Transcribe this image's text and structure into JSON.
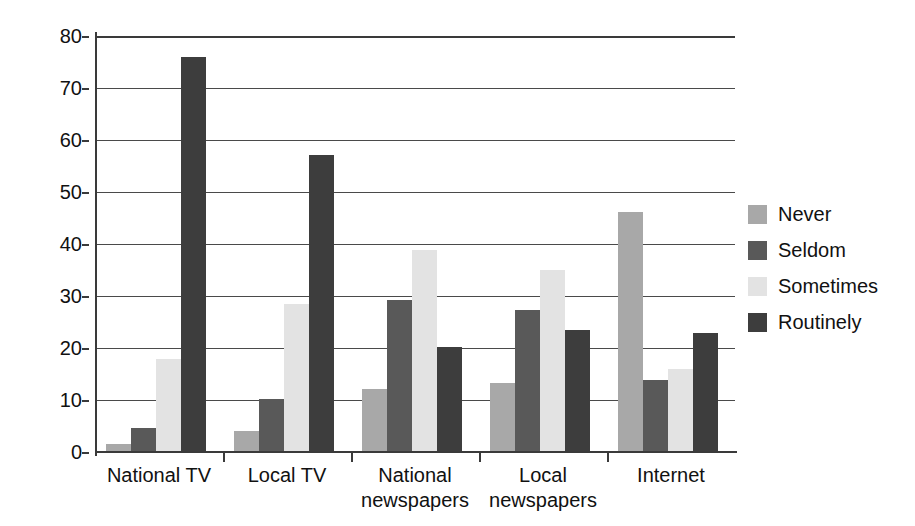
{
  "chart_data": {
    "type": "bar",
    "title": "",
    "xlabel": "",
    "ylabel": "",
    "ylim": [
      0,
      80
    ],
    "ytick_step": 10,
    "yticks": [
      80,
      70,
      60,
      50,
      40,
      30,
      20,
      10,
      0
    ],
    "grid": true,
    "legend_position": "right",
    "categories": [
      {
        "label": "National TV",
        "line1": "National TV",
        "line2": ""
      },
      {
        "label": "Local TV",
        "line1": "Local TV",
        "line2": ""
      },
      {
        "label": "National newspapers",
        "line1": "National",
        "line2": "newspapers"
      },
      {
        "label": "Local newspapers",
        "line1": "Local",
        "line2": "newspapers"
      },
      {
        "label": "Internet",
        "line1": "Internet",
        "line2": ""
      }
    ],
    "series": [
      {
        "name": "Never",
        "color": "#a8a8a8",
        "values": [
          1.5,
          4,
          12.2,
          13.2,
          46.2
        ]
      },
      {
        "name": "Seldom",
        "color": "#595959",
        "values": [
          4.7,
          10.1,
          29.3,
          27.4,
          13.9
        ]
      },
      {
        "name": "Sometimes",
        "color": "#e3e3e3",
        "values": [
          17.9,
          28.4,
          38.9,
          35,
          16
        ]
      },
      {
        "name": "Routinely",
        "color": "#3d3d3d",
        "values": [
          76,
          57.2,
          20.1,
          23.5,
          22.8
        ]
      }
    ]
  },
  "legend": {
    "items": [
      {
        "label": "Never"
      },
      {
        "label": "Seldom"
      },
      {
        "label": "Sometimes"
      },
      {
        "label": "Routinely"
      }
    ]
  },
  "axis_labels": {
    "y": [
      "80",
      "70",
      "60",
      "50",
      "40",
      "30",
      "20",
      "10",
      "0"
    ]
  }
}
